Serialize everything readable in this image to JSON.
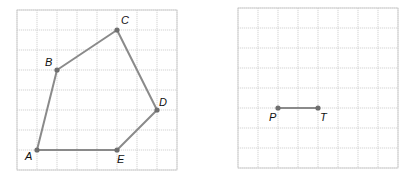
{
  "figures": [
    {
      "name": "pentagon-grid",
      "grid": {
        "x0": 17,
        "y0": 10,
        "cell": 20,
        "cols": 8,
        "rows": 8
      },
      "polygon": [
        "A",
        "B",
        "C",
        "D",
        "E"
      ],
      "points": {
        "A": {
          "gx": 1,
          "gy": 7,
          "label": "A",
          "label_dx": -12,
          "label_dy": 10
        },
        "B": {
          "gx": 2,
          "gy": 3,
          "label": "B",
          "label_dx": -12,
          "label_dy": -4
        },
        "C": {
          "gx": 5,
          "gy": 1,
          "label": "C",
          "label_dx": 4,
          "label_dy": -6
        },
        "D": {
          "gx": 7,
          "gy": 5,
          "label": "D",
          "label_dx": 2,
          "label_dy": -4
        },
        "E": {
          "gx": 5,
          "gy": 7,
          "label": "E",
          "label_dx": 0,
          "label_dy": 13
        }
      }
    },
    {
      "name": "segment-grid",
      "grid": {
        "x0": 238,
        "y0": 8,
        "cell": 20,
        "cols": 8,
        "rows": 8
      },
      "segment": [
        "P",
        "T"
      ],
      "points": {
        "P": {
          "gx": 2,
          "gy": 5,
          "label": "P",
          "label_dx": -9,
          "label_dy": 13
        },
        "T": {
          "gx": 4,
          "gy": 5,
          "label": "T",
          "label_dx": 2,
          "label_dy": 13
        }
      }
    }
  ],
  "labels": {
    "A": "A",
    "B": "B",
    "C": "C",
    "D": "D",
    "E": "E",
    "P": "P",
    "T": "T"
  }
}
